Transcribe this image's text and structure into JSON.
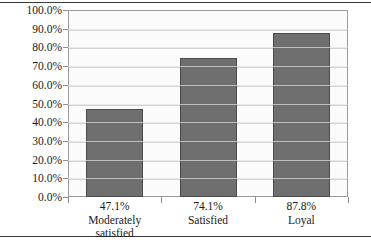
{
  "chart_data": {
    "type": "bar",
    "title": "",
    "subtitle": "",
    "xlabel": "",
    "ylabel": "",
    "categories": [
      "Moderately satisfied",
      "Satisfied",
      "Loyal"
    ],
    "category_lines": [
      [
        "Moderately",
        "satisfied"
      ],
      [
        "Satisfied"
      ],
      [
        "Loyal"
      ]
    ],
    "values": [
      47.1,
      74.1,
      87.8
    ],
    "value_labels": [
      "47.1%",
      "74.1%",
      "87.8%"
    ],
    "ylim": [
      0,
      100
    ],
    "ytick_values": [
      0,
      10,
      20,
      30,
      40,
      50,
      60,
      70,
      80,
      90,
      100
    ],
    "ytick_labels": [
      "0.0%",
      "10.0%",
      "20.0%",
      "30.0%",
      "40.0%",
      "50.0%",
      "60.0%",
      "70.0%",
      "80.0%",
      "90.0%",
      "100.0%"
    ],
    "grid": true,
    "legend": false,
    "legend_position": "none",
    "colors": {
      "bar_fill": "#6f6f6f",
      "bar_border": "#4a4a4a",
      "plot_background": "#fbfbfb",
      "gridline": "#d2d2d2",
      "frame": "#9a9a9a",
      "rule": "#3a3a3a",
      "text": "#1a1a1a"
    }
  }
}
